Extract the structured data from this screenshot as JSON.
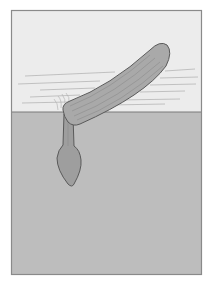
{
  "illustration": {
    "subject": "razor clam partially buried in sand with foot extended",
    "colors": {
      "background": "#ffffff",
      "frame_border": "#8a8a8a",
      "water": "#ececec",
      "water_lines": "#b5b5b5",
      "sand": "#bdbdbd",
      "sand_line": "#7a7a7a",
      "shell_fill": "#a9a9a9",
      "shell_outline": "#5a5a5a",
      "shell_ridges": "#8c8c8c",
      "foot_fill": "#9e9e9e",
      "foot_outline": "#5a5a5a"
    },
    "regions": [
      "water",
      "sand"
    ],
    "parts": [
      "shell",
      "siphon",
      "foot",
      "disturbance-lines"
    ]
  }
}
